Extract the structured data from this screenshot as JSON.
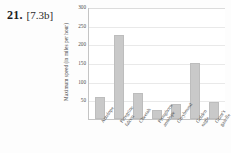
{
  "problem": {
    "number": "21.",
    "reference": "[7.3b]"
  },
  "chart_data": {
    "type": "bar",
    "title": "",
    "xlabel": "",
    "ylabel": "Maximum speed (in miles per hour)",
    "ylim": [
      0,
      300
    ],
    "yticks": [
      50,
      100,
      150,
      200,
      250,
      300
    ],
    "grid": true,
    "legend": "none",
    "categories": [
      "Antelope",
      "Peregrine falcon",
      "Cheetah",
      "Pronghorn antelope",
      "Greyhound",
      "Golden eagle",
      "Grant's gazelle"
    ],
    "category_lines": [
      [
        "Antelope"
      ],
      [
        "Peregrine",
        "falcon"
      ],
      [
        "Cheetah"
      ],
      [
        "Pronghorn",
        "antelope"
      ],
      [
        "Greyhound"
      ],
      [
        "Golden",
        "eagle"
      ],
      [
        "Grant's",
        "gazelle"
      ]
    ],
    "values": [
      60,
      225,
      70,
      25,
      40,
      150,
      45
    ],
    "bar_color": "#c9c9c9",
    "grid_color": "#e9e9e9",
    "axis_color": "#c4c4c4"
  }
}
